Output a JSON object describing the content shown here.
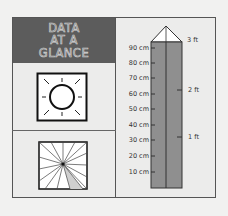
{
  "header": {
    "lines": [
      "DATA",
      "AT A",
      "GLANCE"
    ],
    "background": "#5c5c5c"
  },
  "icons": {
    "top": "sun-icon",
    "bottom": "pinwheel-icon"
  },
  "ruler": {
    "fill_color": "#8f8f8f",
    "cm_labels": [
      "90 cm",
      "80 cm",
      "70 cm",
      "60 cm",
      "50 cm",
      "40 cm",
      "30 cm",
      "20 cm",
      "10 cm"
    ],
    "ft_labels": [
      "3 ft",
      "2 ft",
      "1 ft"
    ]
  }
}
